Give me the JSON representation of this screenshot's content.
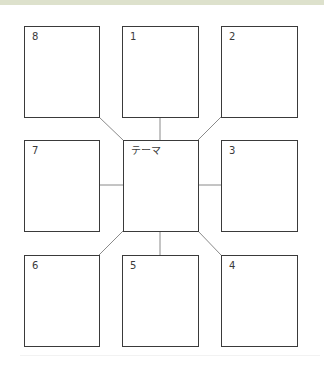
{
  "diagram": {
    "type": "mandala-chart-3x3",
    "center": {
      "label": "テーマ"
    },
    "cells": [
      {
        "position": "top-left",
        "label": "8"
      },
      {
        "position": "top-center",
        "label": "1"
      },
      {
        "position": "top-right",
        "label": "2"
      },
      {
        "position": "middle-left",
        "label": "7"
      },
      {
        "position": "middle-right",
        "label": "3"
      },
      {
        "position": "bottom-left",
        "label": "6"
      },
      {
        "position": "bottom-center",
        "label": "5"
      },
      {
        "position": "bottom-right",
        "label": "4"
      }
    ],
    "colors": {
      "border": "#3a3a3a",
      "connector": "#8a8a8a",
      "top_band": "#dde1cc",
      "background": "#ffffff"
    }
  }
}
